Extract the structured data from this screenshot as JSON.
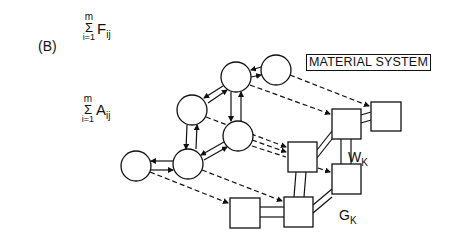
{
  "diagram": {
    "panel_label": "(B)",
    "sum_top": {
      "upper": "m",
      "symbol": "Σ",
      "lower": "i=1",
      "term": "F",
      "subscript": "ij"
    },
    "sum_left": {
      "upper": "m",
      "symbol": "Σ",
      "lower": "i=1",
      "term": "A",
      "subscript": "ij"
    },
    "title": "MATERIAL SYSTEM",
    "label_w": {
      "base": "W",
      "subscript": "K"
    },
    "label_g": {
      "base": "G",
      "subscript": "K"
    },
    "colors": {
      "stroke": "#111111",
      "background": "#ffffff"
    },
    "nodes": {
      "circles": [
        {
          "id": "c1",
          "cx": 276,
          "cy": 70,
          "r": 15
        },
        {
          "id": "c2",
          "cx": 236,
          "cy": 77,
          "r": 15
        },
        {
          "id": "c3",
          "cx": 192,
          "cy": 110,
          "r": 15
        },
        {
          "id": "c4",
          "cx": 238,
          "cy": 136,
          "r": 15
        },
        {
          "id": "c5",
          "cx": 188,
          "cy": 164,
          "r": 15
        },
        {
          "id": "c6",
          "cx": 136,
          "cy": 166,
          "r": 15
        }
      ],
      "squares": [
        {
          "id": "s1",
          "x": 371,
          "y": 102,
          "w": 30,
          "h": 29
        },
        {
          "id": "s2",
          "x": 332,
          "y": 109,
          "w": 29,
          "h": 30
        },
        {
          "id": "s3",
          "x": 288,
          "y": 142,
          "w": 29,
          "h": 30
        },
        {
          "id": "s4",
          "x": 332,
          "y": 164,
          "w": 29,
          "h": 30
        },
        {
          "id": "s5",
          "x": 230,
          "y": 198,
          "w": 30,
          "h": 30
        },
        {
          "id": "s6",
          "x": 284,
          "y": 197,
          "w": 29,
          "h": 30
        }
      ]
    }
  }
}
